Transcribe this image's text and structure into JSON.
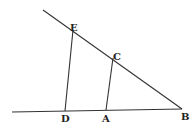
{
  "diagram": {
    "type": "geometry",
    "labels": {
      "E": "E",
      "C": "C",
      "D": "D",
      "A": "A",
      "B": "B"
    },
    "points": {
      "E": [
        73,
        30
      ],
      "C": [
        113,
        57
      ],
      "D": [
        65,
        111
      ],
      "A": [
        106,
        110
      ],
      "B": [
        182,
        109
      ]
    },
    "lines": [
      {
        "name": "line-EB",
        "from": [
          43,
          10
        ],
        "to": [
          182,
          109
        ]
      },
      {
        "name": "line-DB",
        "from": [
          12,
          112
        ],
        "to": [
          182,
          109
        ]
      },
      {
        "name": "segment-ED",
        "from": "E",
        "to": "D"
      },
      {
        "name": "segment-CA",
        "from": "C",
        "to": "A"
      }
    ]
  }
}
